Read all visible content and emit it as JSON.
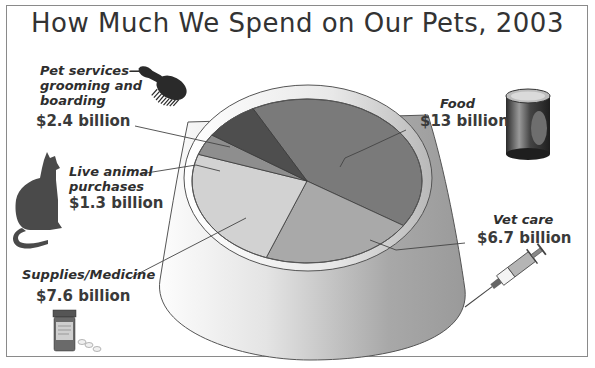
{
  "chart_data": {
    "type": "pie",
    "title": "How Much We Spend on Our Pets, 2003",
    "unit": "billion USD",
    "categories": [
      "Food",
      "Vet care",
      "Supplies/Medicine",
      "Live animal purchases",
      "Pet services—grooming and boarding"
    ],
    "values": [
      13,
      6.7,
      7.6,
      1.3,
      2.4
    ],
    "colors": [
      "#7a7a7a",
      "#a9a9a9",
      "#d2d2d2",
      "#8e8e8e",
      "#4e4e4e"
    ],
    "labels": [
      {
        "name": "Food",
        "value_text": "$13 billion"
      },
      {
        "name": "Vet care",
        "value_text": "$6.7 billion"
      },
      {
        "name": "Supplies/Medicine",
        "value_text": "$7.6 billion"
      },
      {
        "name": "Live animal purchases",
        "value_text": "$1.3 billion"
      },
      {
        "name": "Pet services—grooming and boarding",
        "value_text": "$2.4 billion"
      }
    ],
    "legend": "none (callout labels)"
  },
  "title": "How Much We Spend on Our Pets, 2003",
  "labels": {
    "pet_services": {
      "line1": "Pet services—",
      "line2": "grooming and",
      "line3": "boarding",
      "value": "$2.4 billion"
    },
    "live_animal": {
      "line1": "Live animal",
      "line2": "purchases",
      "value": "$1.3 billion"
    },
    "supplies": {
      "line1": "Supplies/Medicine",
      "value": "$7.6 billion"
    },
    "food": {
      "line1": "Food",
      "value": "$13 billion"
    },
    "vet_care": {
      "line1": "Vet care",
      "value": "$6.7 billion"
    }
  },
  "illustrations": [
    "brush-icon",
    "cat-icon",
    "pill-bottle-icon",
    "food-can-icon",
    "syringe-icon",
    "pet-bowl"
  ]
}
